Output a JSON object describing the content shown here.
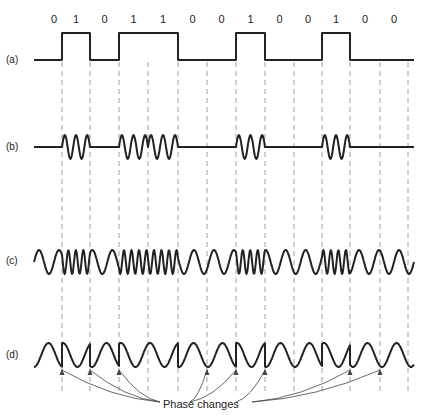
{
  "bits": [
    "0",
    "1",
    "0",
    "1",
    "1",
    "0",
    "0",
    "1",
    "0",
    "0",
    "1",
    "0",
    "0"
  ],
  "bit_boundaries_x": [
    62,
    90,
    119,
    148,
    178,
    207,
    236,
    265,
    294,
    322,
    350,
    380,
    408
  ],
  "rows": [
    {
      "label": "(a)",
      "description": "Binary data signal (NRZ)"
    },
    {
      "label": "(b)",
      "description": "Amplitude-shift keying (ASK)"
    },
    {
      "label": "(c)",
      "description": "Frequency-shift keying (FSK)"
    },
    {
      "label": "(d)",
      "description": "Phase-shift keying (PSK)"
    }
  ],
  "annotation": {
    "text": "Phase changes"
  }
}
